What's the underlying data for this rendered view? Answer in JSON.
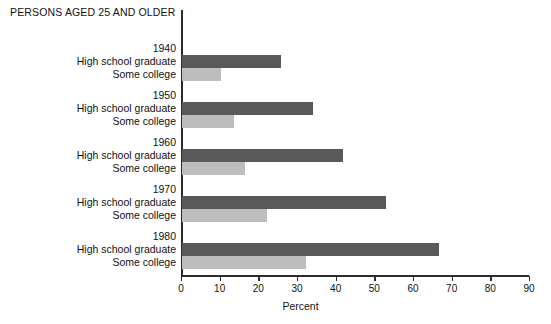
{
  "chart_data": {
    "type": "bar",
    "orientation": "horizontal",
    "title": "PERSONS AGED 25 AND OLDER",
    "xlabel": "Percent",
    "ylabel": "",
    "xlim": [
      0,
      90
    ],
    "xticks": [
      0,
      10,
      20,
      30,
      40,
      50,
      60,
      70,
      80,
      90
    ],
    "grid": false,
    "legend": "none",
    "categories": [
      "1940",
      "1950",
      "1960",
      "1970",
      "1980"
    ],
    "series": [
      {
        "name": "High school graduate",
        "color": "#595959",
        "values": [
          25.6,
          34.0,
          41.6,
          52.8,
          66.5
        ]
      },
      {
        "name": "Some college",
        "color": "#bdbdbd",
        "values": [
          10.0,
          13.5,
          16.3,
          22.0,
          32.0
        ]
      }
    ],
    "groups": [
      {
        "year": "1940",
        "rows": [
          {
            "label": "High school graduate",
            "value": 25.6,
            "series": "hs"
          },
          {
            "label": "Some college",
            "value": 10.0,
            "series": "sc"
          }
        ]
      },
      {
        "year": "1950",
        "rows": [
          {
            "label": "High school graduate",
            "value": 34.0,
            "series": "hs"
          },
          {
            "label": "Some college",
            "value": 13.5,
            "series": "sc"
          }
        ]
      },
      {
        "year": "1960",
        "rows": [
          {
            "label": "High school graduate",
            "value": 41.6,
            "series": "hs"
          },
          {
            "label": "Some college",
            "value": 16.3,
            "series": "sc"
          }
        ]
      },
      {
        "year": "1970",
        "rows": [
          {
            "label": "High school graduate",
            "value": 52.8,
            "series": "hs"
          },
          {
            "label": "Some college",
            "value": 22.0,
            "series": "sc"
          }
        ]
      },
      {
        "year": "1980",
        "rows": [
          {
            "label": "High school graduate",
            "value": 66.5,
            "series": "hs"
          },
          {
            "label": "Some college",
            "value": 32.0,
            "series": "sc"
          }
        ]
      }
    ]
  },
  "layout": {
    "axis_x0_px": 181,
    "axis_x90_px": 529,
    "first_group_top_px": 42,
    "group_pitch_px": 47,
    "bar_height_px": 13
  }
}
